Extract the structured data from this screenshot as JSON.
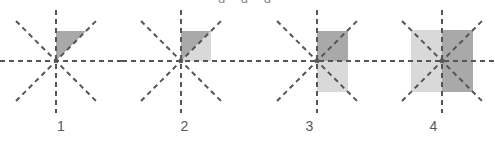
{
  "figure_panel": {
    "width": 495,
    "height": 142,
    "background_color": "#ffffff",
    "top_clipped_text": "g g g",
    "colors": {
      "axis_line": "#555555",
      "shade_dark": "#a9a9a9",
      "shade_light": "#d9d9d9",
      "label_text": "#58585a"
    },
    "axis_style": {
      "dash_length": 5,
      "dash_gap": 4,
      "stroke_width": 2,
      "axes": [
        "horizontal",
        "vertical",
        "diagonal-up-right",
        "diagonal-down-right"
      ]
    },
    "figures": [
      {
        "label": "1",
        "origin_x": 56,
        "origin_y": 61,
        "description": "dark triangle in upper-right quadrant between vertical axis and 45-degree diagonal",
        "shapes": [
          {
            "name": "dark-triangle-q1",
            "type": "polygon",
            "fill": "#a9a9a9",
            "points": "0,0 0,-30 30,-30"
          }
        ]
      },
      {
        "label": "2",
        "origin_x": 181,
        "origin_y": 61,
        "description": "square in upper-right quadrant split by diagonal: dark above, light below",
        "shapes": [
          {
            "name": "dark-triangle-q1-upper",
            "type": "polygon",
            "fill": "#a9a9a9",
            "points": "0,0 0,-30 30,-30"
          },
          {
            "name": "light-triangle-q1-lower",
            "type": "polygon",
            "fill": "#d9d9d9",
            "points": "0,0 30,-30 30,0"
          }
        ]
      },
      {
        "label": "3",
        "origin_x": 317,
        "origin_y": 61,
        "description": "vertical rectangle right of vertical axis: dark upper half, light lower half",
        "shapes": [
          {
            "name": "dark-rect-upper-right",
            "type": "rect",
            "fill": "#a9a9a9",
            "x": 0,
            "y": -30,
            "width": 31,
            "height": 30
          },
          {
            "name": "light-rect-lower-right",
            "type": "rect",
            "fill": "#d9d9d9",
            "x": 0,
            "y": 0,
            "width": 31,
            "height": 31
          }
        ]
      },
      {
        "label": "4",
        "origin_x": 442,
        "origin_y": 61,
        "description": "square centered on origin split by vertical axis: light left half, dark right half",
        "shapes": [
          {
            "name": "light-rect-left-half",
            "type": "rect",
            "fill": "#d9d9d9",
            "x": -31,
            "y": -31,
            "width": 31,
            "height": 62
          },
          {
            "name": "dark-rect-right-half",
            "type": "rect",
            "fill": "#a9a9a9",
            "x": 0,
            "y": -31,
            "width": 31,
            "height": 62
          }
        ]
      }
    ]
  }
}
